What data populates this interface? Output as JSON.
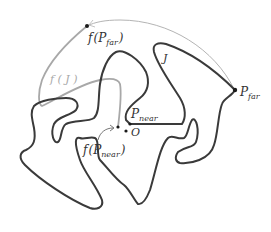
{
  "diagram": {
    "type": "topology-figure",
    "colors": {
      "curve_J": "#3a3a3a",
      "curve_fJ": "#a8a8a8",
      "arc_far": "#b4b4b4",
      "points": "#1a1a1a",
      "background": "#ffffff"
    },
    "labels": {
      "f_P_far": {
        "func": "f",
        "open": "(",
        "base": "P",
        "sub": "far",
        "close": ")"
      },
      "f_J": "f ( J )",
      "J": "J",
      "P_far": {
        "base": "P",
        "sub": "far"
      },
      "P_near": {
        "base": "P",
        "sub": "near"
      },
      "O": "O",
      "f_P_near": {
        "func": "f",
        "open": "(",
        "base": "P",
        "sub": "near",
        "close": ")"
      }
    },
    "points": [
      {
        "name": "f(P_far)",
        "x": 87,
        "y": 26
      },
      {
        "name": "P_far",
        "x": 235,
        "y": 90
      },
      {
        "name": "P_near",
        "x": 130,
        "y": 124
      },
      {
        "name": "f(P_near)",
        "x": 117,
        "y": 128
      },
      {
        "name": "O",
        "x": 125,
        "y": 130
      }
    ]
  }
}
